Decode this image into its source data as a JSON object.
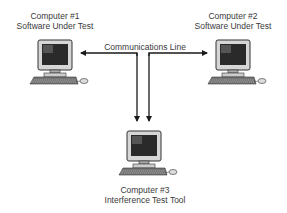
{
  "diagram": {
    "nodes": [
      {
        "id": "computer-1",
        "title": "Computer #1",
        "subtitle": "Software Under Test"
      },
      {
        "id": "computer-2",
        "title": "Computer #2",
        "subtitle": "Software Under Test"
      },
      {
        "id": "computer-3",
        "title": "Computer #3",
        "subtitle": "Interference Test Tool"
      }
    ],
    "edges": [
      {
        "from": "communications-line",
        "to": "computer-1",
        "label": "Communications Line"
      },
      {
        "from": "communications-line",
        "to": "computer-2"
      },
      {
        "from": "communications-line",
        "to": "computer-3"
      }
    ],
    "line_label": "Communications Line",
    "colors": {
      "line": "#1a1a1a",
      "text": "#3a3a3a",
      "screen": "#2b2b2b",
      "body": "#d8d8d8"
    }
  }
}
